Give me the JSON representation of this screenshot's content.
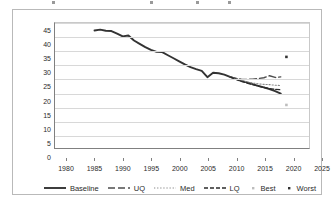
{
  "chart_data": {
    "type": "line",
    "title": "",
    "xlabel": "",
    "ylabel": "",
    "xlim": [
      1980,
      2025
    ],
    "ylim": [
      0,
      45
    ],
    "xticks": [
      1980,
      1985,
      1990,
      1995,
      2000,
      2005,
      2010,
      2015,
      2020,
      2025
    ],
    "yticks": [
      0,
      5,
      10,
      15,
      20,
      25,
      30,
      35,
      40,
      45
    ],
    "grid": "horizontal",
    "legend_position": "bottom",
    "series": [
      {
        "name": "Baseline",
        "style": "solid",
        "color": "#333333",
        "x": [
          1987,
          1988,
          1989,
          1990,
          1991,
          1992,
          1993,
          1994,
          1995,
          1996,
          1997,
          1998,
          1999,
          2000,
          2001,
          2002,
          2003,
          2004,
          2005,
          2006,
          2007,
          2008,
          2009,
          2010,
          2011,
          2012,
          2013,
          2014,
          2015,
          2016,
          2017,
          2018,
          2019,
          2020
        ],
        "values": [
          42.3,
          42.6,
          42.2,
          42.1,
          41.2,
          40.2,
          40.5,
          38.7,
          37.5,
          36.3,
          35.3,
          34.6,
          34.5,
          33.4,
          32.3,
          31.2,
          30.1,
          29.1,
          28.4,
          27.8,
          25.5,
          27.1,
          26.9,
          26.4,
          25.6,
          24.9,
          24.2,
          23.6,
          23.0,
          22.4,
          21.8,
          21.2,
          20.5,
          19.6
        ]
      },
      {
        "name": "UQ",
        "style": "long-dash",
        "color": "#4d4d4d",
        "x": [
          2011,
          2012,
          2013,
          2014,
          2015,
          2016,
          2017,
          2018,
          2019,
          2020
        ],
        "values": [
          25.6,
          25.1,
          24.8,
          24.7,
          24.8,
          25.0,
          25.3,
          26.0,
          25.4,
          25.6
        ]
      },
      {
        "name": "Med",
        "style": "dotted",
        "color": "#8a8a8a",
        "x": [
          2011,
          2012,
          2013,
          2014,
          2015,
          2016,
          2017,
          2018,
          2019,
          2020
        ],
        "values": [
          25.6,
          24.9,
          24.3,
          23.8,
          23.4,
          23.1,
          22.9,
          22.8,
          22.6,
          22.5
        ]
      },
      {
        "name": "LQ",
        "style": "dash-dash",
        "color": "#2b2b2b",
        "x": [
          2011,
          2012,
          2013,
          2014,
          2015,
          2016,
          2017,
          2018,
          2019,
          2020
        ],
        "values": [
          25.6,
          24.8,
          24.0,
          23.4,
          22.8,
          22.3,
          21.8,
          21.4,
          21.1,
          21.0
        ]
      }
    ],
    "points": [
      {
        "name": "Best",
        "marker": "dot",
        "color": "#bdbdbd",
        "x": [
          2021
        ],
        "values": [
          15.5
        ]
      },
      {
        "name": "Worst",
        "marker": "dot",
        "color": "#333333",
        "x": [
          2021
        ],
        "values": [
          32.8
        ]
      }
    ],
    "legend": [
      {
        "label": "Baseline",
        "style": "solid",
        "color": "#333333"
      },
      {
        "label": "UQ",
        "style": "long-dash",
        "color": "#4d4d4d"
      },
      {
        "label": "Med",
        "style": "dotted",
        "color": "#8a8a8a"
      },
      {
        "label": "LQ",
        "style": "dash-dash",
        "color": "#2b2b2b"
      },
      {
        "label": "Best",
        "style": "marker",
        "color": "#bdbdbd"
      },
      {
        "label": "Worst",
        "style": "marker",
        "color": "#333333"
      }
    ]
  },
  "colors": {
    "grid": "#d8d8d8",
    "axis": "#808080",
    "frame": "#b9b9b9",
    "text": "#2b2b2b",
    "background": "#ffffff"
  }
}
